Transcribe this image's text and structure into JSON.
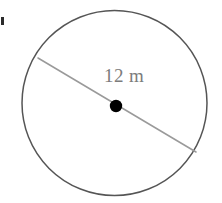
{
  "figure": {
    "background_color": "#ffffff",
    "width": 222,
    "height": 203,
    "circle": {
      "name": "circle-outline",
      "center_x": 114.5,
      "center_y": 103,
      "radius": 92.5,
      "stroke_color": "#555555",
      "stroke_width": 1.5,
      "fill": "none"
    },
    "diameter_line": {
      "name": "diameter-line",
      "x1": 38,
      "y1": 58,
      "x2": 196,
      "y2": 152,
      "stroke_color": "#9a9a9a",
      "stroke_width": 1.5,
      "angle_degrees": 30.7
    },
    "center_point": {
      "name": "center-dot",
      "cx": 116,
      "cy": 106,
      "radius": 6.2,
      "fill_color": "#000000"
    },
    "label": {
      "name": "diameter-label",
      "text": "12 m",
      "value": 12,
      "unit": "m",
      "measurement": "diameter",
      "color": "#7c7c7c",
      "font_size_px": 19,
      "left": 104,
      "top": 66
    },
    "edge_mark": {
      "name": "left-edge-tick",
      "left": 1,
      "top": 17,
      "width": 3,
      "height": 8,
      "color": "#2b2b2b"
    }
  }
}
